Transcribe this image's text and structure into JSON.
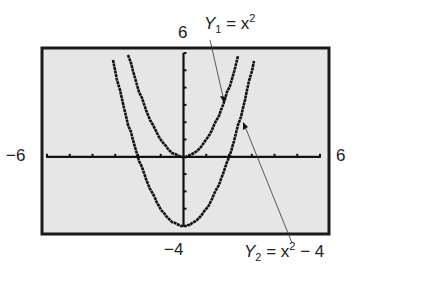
{
  "chart_data": {
    "type": "line",
    "title": "",
    "xlabel": "",
    "ylabel": "",
    "xlim": [
      -6,
      6
    ],
    "ylim": [
      -4,
      6
    ],
    "x_tick_step": 1,
    "y_tick_step": 1,
    "grid": false,
    "window_labels": {
      "xmin": "−6",
      "xmax": "6",
      "ymin": "−4",
      "ymax": "6"
    },
    "series": [
      {
        "name": "Y1 = x^2",
        "expression": "x^2",
        "label_var": "Y",
        "label_sub": "1",
        "label_rhs": "= x",
        "label_sup": "2",
        "label_tail": ""
      },
      {
        "name": "Y2 = x^2 - 4",
        "expression": "x^2 - 4",
        "label_var": "Y",
        "label_sub": "2",
        "label_rhs": "= x",
        "label_sup": "2",
        "label_tail": " − 4"
      }
    ],
    "annotations": [
      {
        "text": "Y1 = x^2",
        "points_to": [
          1.3,
          1.69
        ]
      },
      {
        "text": "Y2 = x^2 - 4",
        "points_to": [
          2.4,
          1.76
        ]
      }
    ],
    "colors": {
      "screen": "#e6e6e6",
      "frame": "#1a1a1a",
      "curve": "#111111"
    }
  }
}
